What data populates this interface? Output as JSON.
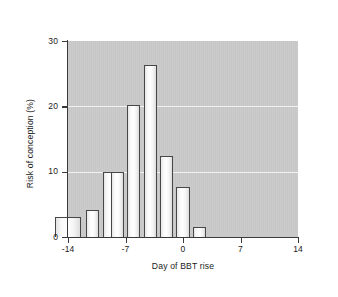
{
  "figure": {
    "background_color": "#ffffff",
    "plot_background_color": "#c9c9c9",
    "gridline_color": "#f2f2f2",
    "axis_color": "#3a3a3a",
    "bar_fill_color": "#fcfcfc",
    "bar_outline_color": "#474747"
  },
  "chart_data": {
    "type": "bar",
    "title": "",
    "subtitle": "",
    "xlabel": "Day of BBT rise",
    "ylabel": "Risk of conception (%)",
    "xlim": [
      -14,
      14
    ],
    "ylim": [
      0,
      30
    ],
    "xticks": [
      -14,
      -7,
      0,
      7,
      14
    ],
    "xtick_labels": [
      "-14",
      "-7",
      "0",
      "7",
      "14"
    ],
    "yticks": [
      0,
      10,
      20,
      30
    ],
    "ytick_labels": [
      "0",
      "10",
      "20",
      "30"
    ],
    "grid": "horizontal",
    "legend": "none",
    "annotations": [],
    "bar_width_days": 1.6,
    "categories": [
      -14,
      -11,
      -9,
      -8,
      -6,
      -4,
      -2,
      0,
      2
    ],
    "values": [
      3.0,
      4.2,
      10.0,
      10.0,
      20.2,
      26.3,
      12.4,
      7.6,
      1.5
    ],
    "bars": [
      {
        "x": -14,
        "value": 3.0,
        "width_days": 3.2
      },
      {
        "x": -11,
        "value": 4.2,
        "width_days": 1.6
      },
      {
        "x": -9,
        "value": 10.0,
        "width_days": 1.6
      },
      {
        "x": -8,
        "value": 10.0,
        "width_days": 1.6
      },
      {
        "x": -6,
        "value": 20.2,
        "width_days": 1.6
      },
      {
        "x": -4,
        "value": 26.3,
        "width_days": 1.6
      },
      {
        "x": -2,
        "value": 12.4,
        "width_days": 1.6
      },
      {
        "x": 0,
        "value": 7.6,
        "width_days": 1.6
      },
      {
        "x": 2,
        "value": 1.5,
        "width_days": 1.6
      }
    ]
  }
}
